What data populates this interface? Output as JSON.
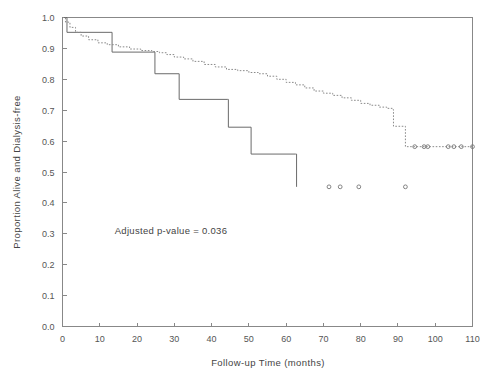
{
  "chart_data": {
    "type": "line",
    "title": "",
    "subtitle": "",
    "xlabel": "Follow-up Time (months)",
    "ylabel": "Proportion Alive and Dialysis-free",
    "xlim": [
      0,
      110
    ],
    "ylim": [
      0,
      1.0
    ],
    "xticks": [
      0,
      10,
      20,
      30,
      40,
      50,
      60,
      70,
      80,
      90,
      100,
      110
    ],
    "xtick_labels": [
      "0",
      "10",
      "20",
      "30",
      "40",
      "50",
      "60",
      "70",
      "80",
      "90",
      "100",
      "110"
    ],
    "yticks": [
      0.0,
      0.1,
      0.2,
      0.3,
      0.4,
      0.5,
      0.6,
      0.7,
      0.8,
      0.9,
      1.0
    ],
    "ytick_labels": [
      "0.0",
      "0.1",
      "0.2",
      "0.3",
      "0.4",
      "0.5",
      "0.6",
      "0.7",
      "0.8",
      "0.9",
      "1.0"
    ],
    "grid": false,
    "legend_position": "none",
    "annotations": [
      {
        "name": "adjusted-p-value",
        "text": "Adjusted p-value = 0.036",
        "x": 14,
        "y": 0.3
      }
    ],
    "series": [
      {
        "name": "solid-group",
        "style": "solid",
        "color": "#6a6a6a",
        "step": "post",
        "points": [
          [
            0,
            1.0
          ],
          [
            1.2,
            0.952
          ],
          [
            13.0,
            0.952
          ],
          [
            13.3,
            0.888
          ],
          [
            24.5,
            0.888
          ],
          [
            24.8,
            0.818
          ],
          [
            31.0,
            0.818
          ],
          [
            31.3,
            0.735
          ],
          [
            44.2,
            0.735
          ],
          [
            44.5,
            0.645
          ],
          [
            50.3,
            0.645
          ],
          [
            50.6,
            0.558
          ],
          [
            62.5,
            0.558
          ],
          [
            62.8,
            0.452
          ]
        ],
        "censor_points": [
          [
            71.5,
            0.452
          ],
          [
            74.5,
            0.452
          ],
          [
            79.5,
            0.452
          ],
          [
            92.0,
            0.452
          ]
        ]
      },
      {
        "name": "dashed-group",
        "style": "dashed",
        "color": "#8a8a8a",
        "step": "post",
        "points": [
          [
            0,
            1.0
          ],
          [
            0.8,
            0.985
          ],
          [
            2.0,
            0.968
          ],
          [
            3.5,
            0.952
          ],
          [
            5.0,
            0.94
          ],
          [
            7.0,
            0.928
          ],
          [
            9.5,
            0.918
          ],
          [
            12.0,
            0.912
          ],
          [
            15.0,
            0.905
          ],
          [
            18.0,
            0.898
          ],
          [
            21.0,
            0.893
          ],
          [
            24.0,
            0.89
          ],
          [
            26.0,
            0.886
          ],
          [
            28.0,
            0.88
          ],
          [
            30.0,
            0.872
          ],
          [
            32.5,
            0.866
          ],
          [
            35.0,
            0.858
          ],
          [
            38.0,
            0.848
          ],
          [
            41.0,
            0.84
          ],
          [
            44.0,
            0.832
          ],
          [
            47.0,
            0.828
          ],
          [
            50.0,
            0.822
          ],
          [
            52.5,
            0.818
          ],
          [
            55.0,
            0.81
          ],
          [
            57.5,
            0.8
          ],
          [
            60.0,
            0.79
          ],
          [
            62.5,
            0.782
          ],
          [
            65.0,
            0.772
          ],
          [
            67.5,
            0.762
          ],
          [
            70.0,
            0.755
          ],
          [
            72.5,
            0.748
          ],
          [
            75.0,
            0.74
          ],
          [
            77.5,
            0.732
          ],
          [
            80.0,
            0.722
          ],
          [
            82.5,
            0.716
          ],
          [
            85.0,
            0.71
          ],
          [
            87.0,
            0.706
          ],
          [
            88.5,
            0.702
          ],
          [
            88.8,
            0.648
          ],
          [
            91.5,
            0.648
          ],
          [
            92.0,
            0.582
          ],
          [
            110,
            0.582
          ]
        ],
        "censor_points": [
          [
            94.5,
            0.582
          ],
          [
            97.0,
            0.582
          ],
          [
            98.0,
            0.582
          ],
          [
            103.5,
            0.582
          ],
          [
            105.0,
            0.582
          ],
          [
            107.0,
            0.582
          ],
          [
            110.0,
            0.582
          ]
        ]
      }
    ]
  },
  "figure": {
    "width": 496,
    "height": 377,
    "background": "#ffffff",
    "axis_color": "#888888",
    "text_color": "#4a4a4a"
  }
}
